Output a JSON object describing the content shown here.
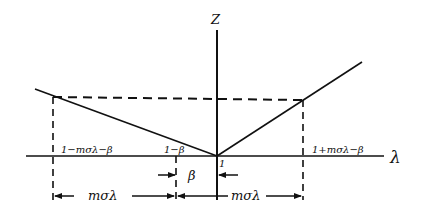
{
  "diagram": {
    "axes": {
      "vertical_label": "Z",
      "horizontal_label": "λ"
    },
    "tick_labels": {
      "left_outer": "1−mσλ−β",
      "left_inner": "1−β",
      "origin": "1",
      "right_outer": "1+mσλ−β"
    },
    "dimensions": {
      "left_span": "mσλ",
      "beta_gap": "β",
      "right_span": "mσλ"
    },
    "colors": {
      "ink": "#111111",
      "background": "#ffffff"
    }
  }
}
